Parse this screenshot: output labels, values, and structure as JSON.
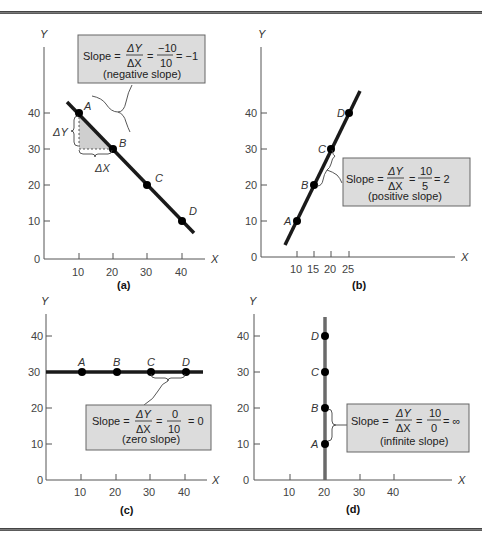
{
  "figure": {
    "panels": [
      {
        "id": "a",
        "caption": "(a)",
        "x_label": "X",
        "y_label": "Y",
        "x_ticks": [
          "10",
          "20",
          "30",
          "40"
        ],
        "y_ticks": [
          "0",
          "10",
          "20",
          "30",
          "40"
        ],
        "points": [
          {
            "label": "A",
            "x": 10,
            "y": 40
          },
          {
            "label": "B",
            "x": 20,
            "y": 30
          },
          {
            "label": "C",
            "x": 30,
            "y": 20
          },
          {
            "label": "D",
            "x": 40,
            "y": 10
          }
        ],
        "delta_y_label": "ΔY",
        "delta_x_label": "ΔX",
        "box": {
          "slope_label": "Slope =",
          "num1": "ΔY",
          "den1": "ΔX",
          "eq": "=",
          "num2": "−10",
          "den2": "10",
          "result": "= −1",
          "note": "(negative slope)"
        }
      },
      {
        "id": "b",
        "caption": "(b)",
        "x_label": "X",
        "y_label": "Y",
        "x_ticks": [
          "10",
          "15",
          "20",
          "25"
        ],
        "y_ticks": [
          "0",
          "10",
          "20",
          "30",
          "40"
        ],
        "points": [
          {
            "label": "A",
            "x": 10,
            "y": 10
          },
          {
            "label": "B",
            "x": 15,
            "y": 20
          },
          {
            "label": "C",
            "x": 20,
            "y": 30
          },
          {
            "label": "D",
            "x": 25,
            "y": 40
          }
        ],
        "box": {
          "slope_label": "Slope =",
          "num1": "ΔY",
          "den1": "ΔX",
          "eq": "=",
          "num2": "10",
          "den2": "5",
          "result": "= 2",
          "note": "(positive slope)"
        }
      },
      {
        "id": "c",
        "caption": "(c)",
        "x_label": "X",
        "y_label": "Y",
        "x_ticks": [
          "10",
          "20",
          "30",
          "40"
        ],
        "y_ticks": [
          "0",
          "10",
          "20",
          "30",
          "40"
        ],
        "points": [
          {
            "label": "A",
            "x": 10,
            "y": 30
          },
          {
            "label": "B",
            "x": 20,
            "y": 30
          },
          {
            "label": "C",
            "x": 30,
            "y": 30
          },
          {
            "label": "D",
            "x": 40,
            "y": 30
          }
        ],
        "box": {
          "slope_label": "Slope =",
          "num1": "ΔY",
          "den1": "ΔX",
          "eq": "=",
          "num2": "0",
          "den2": "10",
          "result": "= 0",
          "note": "(zero slope)"
        }
      },
      {
        "id": "d",
        "caption": "(d)",
        "x_label": "X",
        "y_label": "Y",
        "x_ticks": [
          "10",
          "20",
          "30",
          "40"
        ],
        "y_ticks": [
          "0",
          "10",
          "20",
          "30",
          "40"
        ],
        "points": [
          {
            "label": "A",
            "x": 20,
            "y": 10
          },
          {
            "label": "B",
            "x": 20,
            "y": 20
          },
          {
            "label": "C",
            "x": 20,
            "y": 30
          },
          {
            "label": "D",
            "x": 20,
            "y": 40
          }
        ],
        "box": {
          "slope_label": "Slope =",
          "num1": "ΔY",
          "den1": "ΔX",
          "eq": "=",
          "num2": "10",
          "den2": "0",
          "result": "= ∞",
          "note": "(infinite slope)"
        }
      }
    ],
    "colors": {
      "line": "#1a1a1a",
      "vertical_line": "#6a6a6a",
      "box_fill": "#dcdcdc",
      "triangle_fill": "#cfcfcf"
    }
  }
}
